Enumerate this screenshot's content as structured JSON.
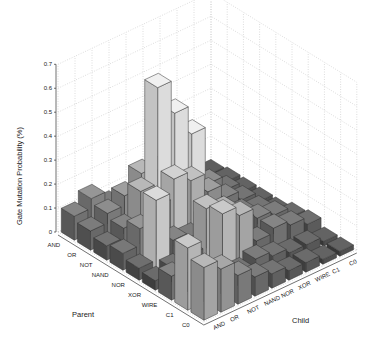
{
  "chart_data": {
    "type": "bar3d",
    "title": "",
    "zlabel": "Gate Mutation Probability (%)",
    "xlabel": "Parent",
    "ylabel": "Child",
    "zlim": [
      0,
      0.7
    ],
    "zticks": [
      "0",
      "0.1",
      "0.2",
      "0.3",
      "0.4",
      "0.5",
      "0.6",
      "0.7"
    ],
    "parent_categories": [
      "AND",
      "OR",
      "NOT",
      "NAND",
      "NOR",
      "XOR",
      "WIRE",
      "C1",
      "C0"
    ],
    "child_categories": [
      "AND",
      "OR",
      "NOT",
      "NAND",
      "NOR",
      "XOR",
      "WIRE",
      "C1",
      "C0"
    ],
    "grid": true,
    "values": [
      [
        0.1,
        0.14,
        0.08,
        0.06,
        0.04,
        0.03,
        0.03,
        0.02,
        0.01
      ],
      [
        0.08,
        0.12,
        0.16,
        0.22,
        0.2,
        0.1,
        0.06,
        0.04,
        0.02
      ],
      [
        0.06,
        0.1,
        0.22,
        0.62,
        0.48,
        0.36,
        0.12,
        0.06,
        0.02
      ],
      [
        0.07,
        0.14,
        0.2,
        0.28,
        0.24,
        0.16,
        0.1,
        0.06,
        0.02
      ],
      [
        0.05,
        0.3,
        0.1,
        0.08,
        0.12,
        0.1,
        0.08,
        0.06,
        0.02
      ],
      [
        0.04,
        0.06,
        0.08,
        0.24,
        0.2,
        0.12,
        0.1,
        0.08,
        0.04
      ],
      [
        0.1,
        0.08,
        0.06,
        0.26,
        0.22,
        0.08,
        0.1,
        0.08,
        0.05
      ],
      [
        0.26,
        0.14,
        0.1,
        0.06,
        0.08,
        0.06,
        0.04,
        0.04,
        0.02
      ],
      [
        0.22,
        0.18,
        0.12,
        0.08,
        0.06,
        0.04,
        0.04,
        0.02,
        0.02
      ]
    ]
  },
  "labels": {
    "zlabel": "Gate Mutation Probability (%)",
    "parent": "Parent",
    "child": "Child"
  }
}
